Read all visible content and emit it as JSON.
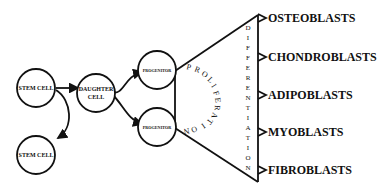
{
  "diagram": {
    "type": "cell-lineage-flow",
    "nodes": {
      "stem_cell_1": "STEM CELL",
      "stem_cell_2": "STEM CELL",
      "daughter_cell_line1": "DAUGHTER",
      "daughter_cell_line2": "CELL",
      "progenitor_1": "PROGENITOR",
      "progenitor_2": "PROGENITOR"
    },
    "stages": {
      "proliferation": [
        "P",
        "R",
        "O",
        "L",
        "I",
        "F",
        "E",
        "R",
        "A",
        "T",
        "I",
        "O",
        "N"
      ],
      "differentiation": [
        "D",
        "I",
        "F",
        "F",
        "E",
        "R",
        "E",
        "N",
        "T",
        "I",
        "A",
        "T",
        "I",
        "O",
        "N"
      ]
    },
    "outputs": [
      "OSTEOBLASTS",
      "CHONDROBLASTS",
      "ADIPOBLASTS",
      "MYOBLASTS",
      "FIBROBLASTS"
    ],
    "colors": {
      "line": "#111111",
      "background": "#ffffff"
    }
  }
}
